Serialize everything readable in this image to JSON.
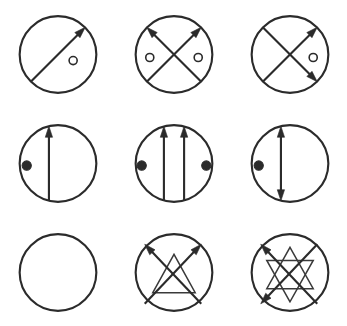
{
  "canvas": {
    "width": 347,
    "height": 326,
    "background": "#ffffff",
    "stroke_color": "#2b2b2b",
    "thin_stroke_color": "#3a3a3a",
    "marker_open_fill": "#ffffff"
  },
  "chart_data": {
    "type": "diagram",
    "title": "",
    "layout": {
      "rows": 3,
      "columns": 3,
      "cell_width": 115.7,
      "cell_height": 108.7
    },
    "circle": {
      "radius": 38,
      "center_x": 57,
      "center_y": 54
    },
    "panels": [
      {
        "id": "panel-1",
        "row": 1,
        "column": 1,
        "label": "circle-with-single-diagonal-arrow-and-one-open-marker",
        "circle": {
          "cx": 57,
          "cy": 54,
          "r": 38
        },
        "lines": [
          {
            "name": "diagonal-sw-ne",
            "x1": 30,
            "y1": 81,
            "x2": 84,
            "y2": 27,
            "arrow_start": false,
            "arrow_end": true,
            "weight": "thick"
          }
        ],
        "markers": [
          {
            "name": "open-marker-right",
            "type": "open",
            "cx": 72,
            "cy": 60,
            "r": 4
          }
        ]
      },
      {
        "id": "panel-2",
        "row": 1,
        "column": 2,
        "label": "circle-with-x-crossing-two-up-arrows-and-two-open-markers",
        "circle": {
          "cx": 57,
          "cy": 54,
          "r": 38
        },
        "lines": [
          {
            "name": "diagonal-se-nw",
            "x1": 84,
            "y1": 81,
            "x2": 30,
            "y2": 27,
            "arrow_start": false,
            "arrow_end": true,
            "weight": "thick"
          },
          {
            "name": "diagonal-sw-ne",
            "x1": 30,
            "y1": 81,
            "x2": 84,
            "y2": 27,
            "arrow_start": false,
            "arrow_end": true,
            "weight": "thick"
          }
        ],
        "markers": [
          {
            "name": "open-marker-left",
            "type": "open",
            "cx": 33,
            "cy": 57,
            "r": 4
          },
          {
            "name": "open-marker-right",
            "type": "open",
            "cx": 81,
            "cy": 57,
            "r": 4
          }
        ]
      },
      {
        "id": "panel-3",
        "row": 1,
        "column": 3,
        "label": "circle-with-x-crossing-two-right-arrows-and-one-open-marker",
        "circle": {
          "cx": 57,
          "cy": 54,
          "r": 38
        },
        "lines": [
          {
            "name": "diagonal-sw-ne",
            "x1": 30,
            "y1": 81,
            "x2": 84,
            "y2": 27,
            "arrow_start": false,
            "arrow_end": true,
            "weight": "thick"
          },
          {
            "name": "diagonal-nw-se",
            "x1": 30,
            "y1": 27,
            "x2": 84,
            "y2": 81,
            "arrow_start": false,
            "arrow_end": true,
            "weight": "thick"
          }
        ],
        "markers": [
          {
            "name": "open-marker-right",
            "type": "open",
            "cx": 80,
            "cy": 57,
            "r": 4
          }
        ]
      },
      {
        "id": "panel-4",
        "row": 2,
        "column": 1,
        "label": "circle-with-vertical-up-arrow-chord-and-one-filled-marker",
        "circle": {
          "cx": 57,
          "cy": 54,
          "r": 38
        },
        "lines": [
          {
            "name": "vertical-chord-up",
            "x1": 48,
            "y1": 91,
            "x2": 48,
            "y2": 17,
            "arrow_start": false,
            "arrow_end": true,
            "weight": "thick"
          }
        ],
        "markers": [
          {
            "name": "filled-marker-left",
            "type": "filled",
            "cx": 26,
            "cy": 56,
            "r": 4.6
          }
        ]
      },
      {
        "id": "panel-5",
        "row": 2,
        "column": 2,
        "label": "circle-with-two-parallel-up-arrow-chords-and-two-filled-markers",
        "circle": {
          "cx": 57,
          "cy": 54,
          "r": 38
        },
        "lines": [
          {
            "name": "vertical-chord-left-up",
            "x1": 47,
            "y1": 91,
            "x2": 47,
            "y2": 17,
            "arrow_start": false,
            "arrow_end": true,
            "weight": "thick"
          },
          {
            "name": "vertical-chord-right-up",
            "x1": 67,
            "y1": 91,
            "x2": 67,
            "y2": 17,
            "arrow_start": false,
            "arrow_end": true,
            "weight": "thick"
          }
        ],
        "markers": [
          {
            "name": "filled-marker-left",
            "type": "filled",
            "cx": 25,
            "cy": 56,
            "r": 4.6
          },
          {
            "name": "filled-marker-right",
            "type": "filled",
            "cx": 89,
            "cy": 56,
            "r": 4.6
          }
        ]
      },
      {
        "id": "panel-6",
        "row": 2,
        "column": 3,
        "label": "circle-with-double-headed-vertical-chord-and-one-filled-marker",
        "circle": {
          "cx": 57,
          "cy": 54,
          "r": 38
        },
        "lines": [
          {
            "name": "vertical-chord-double",
            "x1": 48,
            "y1": 91,
            "x2": 48,
            "y2": 17,
            "arrow_start": true,
            "arrow_end": true,
            "weight": "thick"
          }
        ],
        "markers": [
          {
            "name": "filled-marker-left",
            "type": "filled",
            "cx": 26,
            "cy": 56,
            "r": 4.6
          }
        ]
      },
      {
        "id": "panel-7",
        "row": 3,
        "column": 1,
        "label": "empty-circle",
        "circle": {
          "cx": 57,
          "cy": 54,
          "r": 38
        },
        "lines": [],
        "markers": []
      },
      {
        "id": "panel-8",
        "row": 3,
        "column": 2,
        "label": "circle-with-x-two-up-arrows-and-inner-triangle",
        "circle": {
          "cx": 57,
          "cy": 54,
          "r": 38
        },
        "lines": [
          {
            "name": "diagonal-se-nw",
            "x1": 84,
            "y1": 85,
            "x2": 28,
            "y2": 26,
            "arrow_start": false,
            "arrow_end": true,
            "weight": "thick"
          },
          {
            "name": "diagonal-sw-ne",
            "x1": 28,
            "y1": 85,
            "x2": 84,
            "y2": 26,
            "arrow_start": false,
            "arrow_end": true,
            "weight": "thick"
          }
        ],
        "polygons": [
          {
            "name": "inner-triangle",
            "points": "36,74 57,36 78,74",
            "closed": true,
            "weight": "thin"
          }
        ],
        "markers": []
      },
      {
        "id": "panel-9",
        "row": 3,
        "column": 3,
        "label": "circle-with-x-two-left-arrows-and-inner-six-pointed-star",
        "circle": {
          "cx": 57,
          "cy": 54,
          "r": 38
        },
        "lines": [
          {
            "name": "diagonal-se-nw",
            "x1": 84,
            "y1": 85,
            "x2": 28,
            "y2": 26,
            "arrow_start": false,
            "arrow_end": true,
            "weight": "thick"
          },
          {
            "name": "diagonal-ne-sw",
            "x1": 84,
            "y1": 26,
            "x2": 28,
            "y2": 85,
            "arrow_start": false,
            "arrow_end": true,
            "weight": "thick"
          }
        ],
        "polygons": [
          {
            "name": "inner-star-triangle-up",
            "points": "57,29 80,70 34,70",
            "closed": true,
            "weight": "thin"
          },
          {
            "name": "inner-star-triangle-down",
            "points": "57,83 34,42 80,42",
            "closed": true,
            "weight": "thin"
          }
        ],
        "markers": []
      }
    ]
  }
}
